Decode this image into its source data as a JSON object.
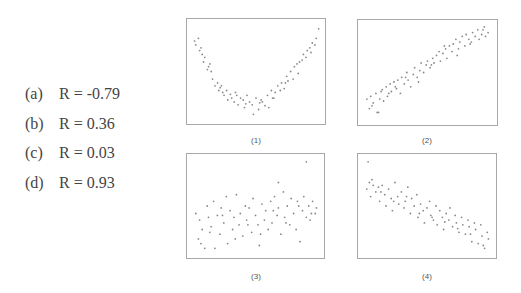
{
  "answers": [
    {
      "label": "(a)",
      "text": "R = -0.79"
    },
    {
      "label": "(b)",
      "text": "R = 0.36"
    },
    {
      "label": "(c)",
      "text": "R = 0.03"
    },
    {
      "label": "(d)",
      "text": "R = 0.93"
    }
  ],
  "plots": [
    {
      "caption": "(1)"
    },
    {
      "caption": "(2)"
    },
    {
      "caption": "(3)"
    },
    {
      "caption": "(4)"
    }
  ],
  "colors": {
    "point": "#8a8a8a",
    "frame": "#a8a8a8"
  },
  "chart_data": [
    {
      "type": "scatter",
      "title": "(1)",
      "xlabel": "",
      "ylabel": "",
      "grid": false,
      "description": "U-shaped (quadratic) relationship, weak linear correlation",
      "x": [
        0.02,
        0.03,
        0.05,
        0.06,
        0.08,
        0.09,
        0.1,
        0.12,
        0.13,
        0.15,
        0.16,
        0.18,
        0.2,
        0.21,
        0.22,
        0.24,
        0.25,
        0.27,
        0.28,
        0.3,
        0.31,
        0.33,
        0.34,
        0.36,
        0.38,
        0.4,
        0.41,
        0.43,
        0.45,
        0.47,
        0.48,
        0.5,
        0.52,
        0.54,
        0.55,
        0.57,
        0.59,
        0.6,
        0.62,
        0.64,
        0.65,
        0.67,
        0.69,
        0.7,
        0.72,
        0.74,
        0.75,
        0.77,
        0.79,
        0.8,
        0.82,
        0.84,
        0.86,
        0.87,
        0.89,
        0.9,
        0.92,
        0.94,
        0.96,
        0.97,
        0.99,
        0.07,
        0.14,
        0.23,
        0.35,
        0.42,
        0.53,
        0.63,
        0.73,
        0.83,
        0.93
      ],
      "y": [
        0.82,
        0.78,
        0.85,
        0.72,
        0.68,
        0.6,
        0.65,
        0.52,
        0.55,
        0.5,
        0.42,
        0.35,
        0.38,
        0.3,
        0.33,
        0.28,
        0.25,
        0.3,
        0.2,
        0.26,
        0.22,
        0.18,
        0.28,
        0.15,
        0.22,
        0.2,
        0.12,
        0.25,
        0.18,
        0.15,
        0.05,
        0.22,
        0.1,
        0.2,
        0.18,
        0.14,
        0.25,
        0.12,
        0.3,
        0.22,
        0.28,
        0.35,
        0.3,
        0.38,
        0.32,
        0.45,
        0.4,
        0.5,
        0.42,
        0.55,
        0.58,
        0.6,
        0.62,
        0.68,
        0.65,
        0.72,
        0.75,
        0.8,
        0.78,
        0.85,
        0.95,
        0.75,
        0.58,
        0.35,
        0.25,
        0.16,
        0.17,
        0.22,
        0.38,
        0.48,
        0.7
      ]
    },
    {
      "type": "scatter",
      "title": "(2)",
      "xlabel": "",
      "ylabel": "",
      "grid": false,
      "description": "Strong positive linear relationship",
      "x": [
        0.03,
        0.05,
        0.06,
        0.08,
        0.1,
        0.11,
        0.13,
        0.14,
        0.16,
        0.18,
        0.19,
        0.21,
        0.22,
        0.24,
        0.26,
        0.27,
        0.29,
        0.3,
        0.32,
        0.34,
        0.35,
        0.37,
        0.39,
        0.4,
        0.42,
        0.44,
        0.45,
        0.47,
        0.49,
        0.5,
        0.52,
        0.54,
        0.55,
        0.57,
        0.59,
        0.6,
        0.62,
        0.64,
        0.65,
        0.67,
        0.69,
        0.7,
        0.72,
        0.74,
        0.75,
        0.77,
        0.79,
        0.8,
        0.82,
        0.84,
        0.85,
        0.87,
        0.89,
        0.9,
        0.92,
        0.94,
        0.95,
        0.97,
        0.07,
        0.15,
        0.25,
        0.33,
        0.43,
        0.53,
        0.63,
        0.73,
        0.83,
        0.93,
        0.12,
        0.2
      ],
      "y": [
        0.22,
        0.12,
        0.25,
        0.18,
        0.28,
        0.08,
        0.22,
        0.3,
        0.2,
        0.35,
        0.25,
        0.38,
        0.3,
        0.4,
        0.33,
        0.42,
        0.28,
        0.45,
        0.38,
        0.5,
        0.42,
        0.35,
        0.48,
        0.55,
        0.45,
        0.52,
        0.6,
        0.5,
        0.58,
        0.62,
        0.55,
        0.65,
        0.6,
        0.68,
        0.72,
        0.62,
        0.7,
        0.75,
        0.65,
        0.78,
        0.72,
        0.8,
        0.85,
        0.75,
        0.82,
        0.88,
        0.78,
        0.9,
        0.85,
        0.82,
        0.92,
        0.88,
        0.95,
        0.85,
        0.9,
        0.98,
        0.88,
        0.92,
        0.15,
        0.32,
        0.35,
        0.45,
        0.4,
        0.58,
        0.78,
        0.68,
        0.8,
        0.95,
        0.08,
        0.28
      ]
    },
    {
      "type": "scatter",
      "title": "(3)",
      "xlabel": "",
      "ylabel": "",
      "grid": false,
      "description": "Weak positive relationship, wide scatter, two outliers high",
      "x": [
        0.03,
        0.05,
        0.06,
        0.08,
        0.1,
        0.12,
        0.13,
        0.15,
        0.17,
        0.18,
        0.2,
        0.22,
        0.23,
        0.25,
        0.27,
        0.28,
        0.3,
        0.32,
        0.33,
        0.35,
        0.37,
        0.38,
        0.4,
        0.42,
        0.43,
        0.45,
        0.47,
        0.48,
        0.5,
        0.52,
        0.53,
        0.55,
        0.57,
        0.58,
        0.6,
        0.62,
        0.63,
        0.65,
        0.67,
        0.68,
        0.7,
        0.72,
        0.73,
        0.75,
        0.77,
        0.78,
        0.8,
        0.82,
        0.83,
        0.85,
        0.87,
        0.88,
        0.9,
        0.92,
        0.93,
        0.95,
        0.97,
        0.98,
        0.07,
        0.14,
        0.24,
        0.34,
        0.44,
        0.54,
        0.64,
        0.74,
        0.84,
        0.94,
        0.68,
        0.9
      ],
      "y": [
        0.42,
        0.15,
        0.35,
        0.25,
        0.05,
        0.5,
        0.38,
        0.28,
        0.55,
        0.05,
        0.4,
        0.2,
        0.48,
        0.32,
        0.6,
        0.1,
        0.45,
        0.25,
        0.38,
        0.62,
        0.3,
        0.42,
        0.18,
        0.5,
        0.35,
        0.48,
        0.22,
        0.58,
        0.4,
        0.3,
        0.08,
        0.52,
        0.35,
        0.45,
        0.25,
        0.55,
        0.32,
        0.6,
        0.4,
        0.48,
        0.2,
        0.65,
        0.38,
        0.5,
        0.3,
        0.58,
        0.42,
        0.25,
        0.55,
        0.12,
        0.45,
        0.6,
        0.38,
        0.5,
        0.35,
        0.55,
        0.42,
        0.48,
        0.1,
        0.22,
        0.4,
        0.15,
        0.3,
        0.2,
        0.45,
        0.32,
        0.5,
        0.42,
        0.75,
        0.97
      ]
    },
    {
      "type": "scatter",
      "title": "(4)",
      "xlabel": "",
      "ylabel": "",
      "grid": false,
      "description": "Moderate-strong negative linear relationship",
      "x": [
        0.03,
        0.05,
        0.06,
        0.08,
        0.1,
        0.12,
        0.13,
        0.15,
        0.17,
        0.18,
        0.2,
        0.22,
        0.23,
        0.25,
        0.27,
        0.28,
        0.3,
        0.32,
        0.33,
        0.35,
        0.37,
        0.38,
        0.4,
        0.42,
        0.43,
        0.45,
        0.47,
        0.48,
        0.5,
        0.52,
        0.53,
        0.55,
        0.57,
        0.58,
        0.6,
        0.62,
        0.63,
        0.65,
        0.67,
        0.68,
        0.7,
        0.72,
        0.73,
        0.75,
        0.77,
        0.78,
        0.8,
        0.82,
        0.83,
        0.85,
        0.87,
        0.88,
        0.9,
        0.92,
        0.93,
        0.95,
        0.97,
        0.98,
        0.07,
        0.14,
        0.24,
        0.34,
        0.44,
        0.54,
        0.64,
        0.74,
        0.84,
        0.94,
        0.04
      ],
      "y": [
        0.68,
        0.75,
        0.6,
        0.72,
        0.65,
        0.7,
        0.55,
        0.72,
        0.62,
        0.5,
        0.68,
        0.58,
        0.45,
        0.75,
        0.6,
        0.52,
        0.65,
        0.48,
        0.55,
        0.7,
        0.42,
        0.58,
        0.5,
        0.62,
        0.38,
        0.52,
        0.45,
        0.32,
        0.48,
        0.55,
        0.4,
        0.35,
        0.5,
        0.3,
        0.45,
        0.38,
        0.25,
        0.42,
        0.35,
        0.48,
        0.28,
        0.4,
        0.32,
        0.22,
        0.38,
        0.3,
        0.2,
        0.35,
        0.28,
        0.12,
        0.32,
        0.25,
        0.1,
        0.3,
        0.18,
        0.05,
        0.22,
        0.15,
        0.78,
        0.65,
        0.55,
        0.6,
        0.42,
        0.38,
        0.33,
        0.26,
        0.2,
        0.08,
        0.97
      ]
    }
  ]
}
